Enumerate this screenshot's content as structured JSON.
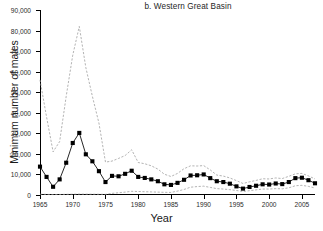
{
  "chart_data": {
    "type": "line",
    "title": "b. Western Great Basin",
    "xlabel": "Year",
    "ylabel": "Minimum number of males",
    "xlim": [
      1965,
      2007
    ],
    "ylim": [
      0,
      90000
    ],
    "xticks": [
      1965,
      1970,
      1975,
      1980,
      1985,
      1990,
      1995,
      2000,
      2005
    ],
    "xtick_labels": [
      "1965",
      "1970",
      "1975",
      "1980",
      "1985",
      "1990",
      "1995",
      "2000",
      "2005"
    ],
    "yticks": [
      0,
      10000,
      20000,
      30000,
      40000,
      50000,
      60000,
      70000,
      80000,
      90000
    ],
    "ytick_labels": [
      "0",
      "10,000",
      "20,000",
      "30,000",
      "40,000",
      "50,000",
      "60,000",
      "70,000",
      "80,000",
      "90,000"
    ],
    "grid": false,
    "legend": "none",
    "x": [
      1965,
      1966,
      1967,
      1968,
      1969,
      1970,
      1971,
      1972,
      1973,
      1974,
      1975,
      1976,
      1977,
      1978,
      1979,
      1980,
      1981,
      1982,
      1983,
      1984,
      1985,
      1986,
      1987,
      1988,
      1989,
      1990,
      1991,
      1992,
      1993,
      1994,
      1995,
      1996,
      1997,
      1998,
      1999,
      2000,
      2001,
      2002,
      2003,
      2004,
      2005,
      2006,
      2007
    ],
    "series": [
      {
        "name": "Minimum number of males (estimate)",
        "style": "line-with-square-markers",
        "color": "#000000",
        "values": [
          13800,
          8800,
          4000,
          7600,
          15700,
          25300,
          30200,
          19800,
          16400,
          11600,
          6300,
          9300,
          9100,
          10300,
          11800,
          8800,
          8300,
          7600,
          6700,
          5200,
          4900,
          5900,
          7400,
          9500,
          9600,
          10000,
          8200,
          6700,
          6300,
          5500,
          4200,
          3100,
          3900,
          4500,
          5200,
          5100,
          5600,
          5300,
          6300,
          8200,
          8400,
          7200,
          5700
        ]
      },
      {
        "name": "Upper bound",
        "style": "dashed",
        "color": "#9a9a9a",
        "values": [
          56000,
          38000,
          21000,
          26000,
          48000,
          68000,
          82000,
          62000,
          48000,
          35000,
          16000,
          16500,
          17800,
          19200,
          22000,
          15800,
          15200,
          14200,
          12600,
          10100,
          9000,
          10500,
          12800,
          14200,
          14100,
          14300,
          12200,
          9700,
          9200,
          8300,
          7000,
          5600,
          6400,
          7100,
          7900,
          7800,
          8300,
          8000,
          9100,
          10300,
          10500,
          9300,
          7800
        ]
      },
      {
        "name": "Lower bound",
        "style": "dashed",
        "color": "#9a9a9a",
        "values": [
          400,
          300,
          200,
          250,
          320,
          380,
          420,
          400,
          380,
          350,
          300,
          800,
          1100,
          1400,
          1800,
          1700,
          1600,
          1500,
          1400,
          1300,
          1250,
          1900,
          2700,
          3800,
          4100,
          4300,
          3700,
          3100,
          2900,
          2600,
          2200,
          1700,
          2100,
          2500,
          2900,
          2900,
          3100,
          3000,
          3500,
          4500,
          4700,
          4200,
          3400
        ]
      }
    ]
  }
}
